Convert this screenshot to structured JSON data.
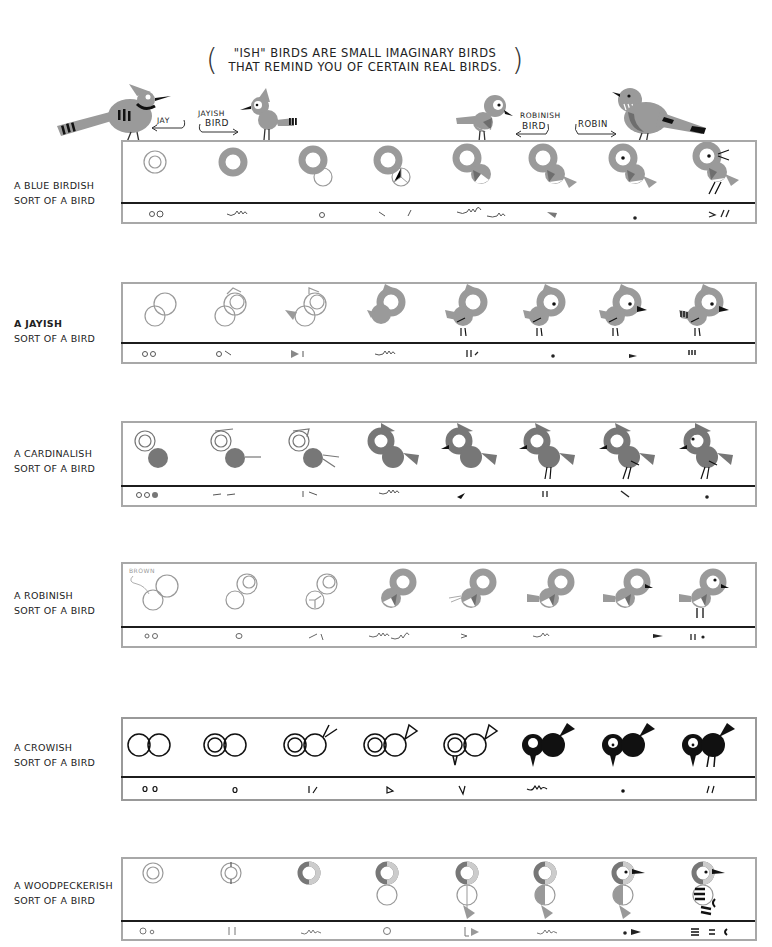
{
  "intro": {
    "line1": "\"ISH\" BIRDS ARE SMALL IMAGINARY BIRDS",
    "line2": "THAT REMIND YOU OF CERTAIN REAL BIRDS."
  },
  "top_scene": {
    "labels": {
      "jay": "JAY",
      "jayish_1": "JAYISH",
      "jayish_2": "BIRD",
      "robinish_1": "ROBINISH",
      "robinish_2": "BIRD",
      "robin": "ROBIN"
    }
  },
  "colors": {
    "bird_gray": "#9a9a9a",
    "dark_gray": "#6e6e6e",
    "ink": "#111111",
    "frame": "#a8a8a8",
    "cardinal_body": "#808080"
  },
  "rows": [
    {
      "label1": "A BLUE BIRDISH",
      "label2": "SORT OF A BIRD",
      "steps": 8,
      "strokes": [
        "oo",
        "wavy",
        "o",
        "\\ /",
        "wavy wavy",
        "wedge",
        "dot",
        "> //"
      ]
    },
    {
      "label1": "A JAYISH",
      "label2": "SORT OF A BIRD",
      "steps": 8,
      "strokes": [
        "oo",
        "o \\",
        "triangle |",
        "wavy",
        "|| /",
        "dot",
        "wedge",
        "tail bars"
      ]
    },
    {
      "label1": "A CARDINALISH",
      "label2": "SORT OF A BIRD",
      "steps": 8,
      "strokes": [
        "ooo (filled)",
        "-- --",
        "| --",
        "wavy",
        "beak",
        "||",
        "\\",
        "dot"
      ]
    },
    {
      "label1": "A ROBINISH",
      "label2": "SORT OF A BIRD",
      "steps": 8,
      "note": "BROWN",
      "strokes": [
        "oo",
        "o",
        "/ \\",
        "wavy wavy",
        ">",
        "wavy",
        "wedge",
        "|| dot"
      ]
    },
    {
      "label1": "A CROWISH",
      "label2": "SORT OF A BIRD",
      "steps": 8,
      "strokes": [
        "o o",
        "o",
        "| /",
        "triangle",
        "V",
        "wavy",
        "dot",
        "//"
      ]
    },
    {
      "label1": "A WOODPECKERISH",
      "label2": "SORT OF A BIRD",
      "steps": 8,
      "strokes": [
        "Oo",
        "||",
        "wavy",
        "o",
        "| triangle",
        "wavy",
        "dot wedge",
        "stripes = ("
      ]
    }
  ]
}
